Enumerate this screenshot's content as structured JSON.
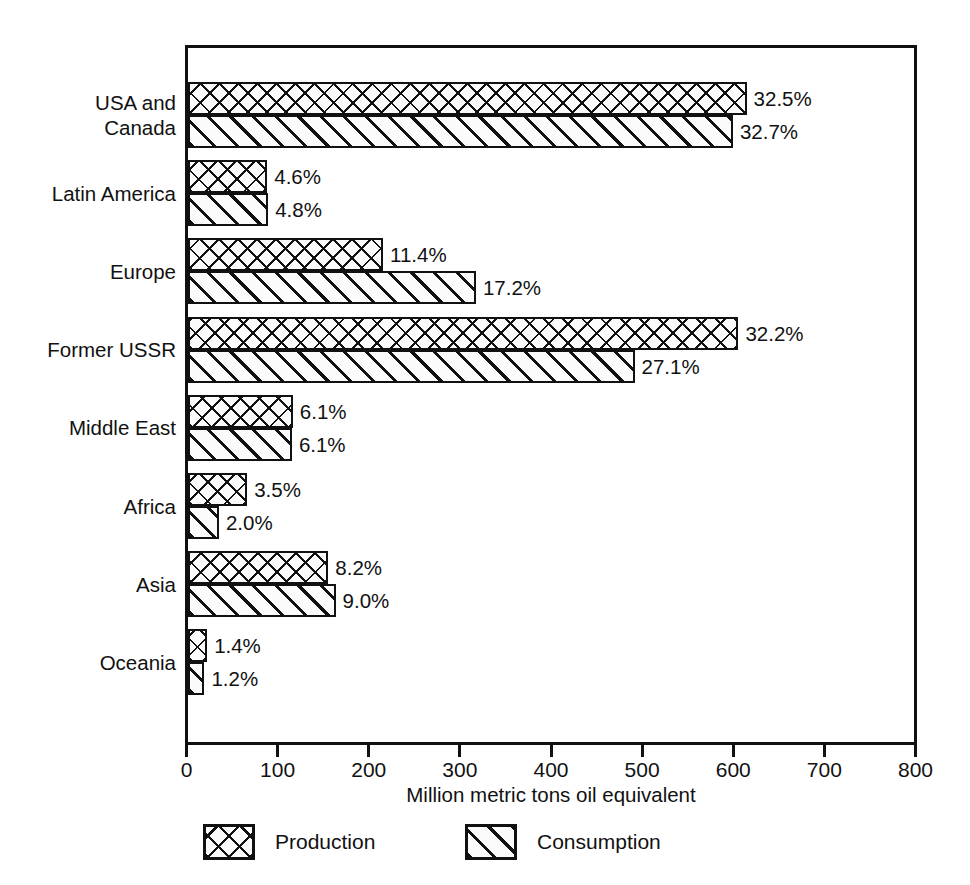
{
  "chart_data": {
    "type": "bar",
    "orientation": "horizontal",
    "title": "",
    "xlabel": "Million metric tons oil equivalent",
    "ylabel": "",
    "xlim": [
      0,
      800
    ],
    "xticks": [
      0,
      100,
      200,
      300,
      400,
      500,
      600,
      700,
      800
    ],
    "xtick_labels": [
      "0",
      "100",
      "200",
      "300",
      "400",
      "500",
      "600",
      "700",
      "800"
    ],
    "grid": false,
    "legend_position": "bottom",
    "categories": [
      "USA and\nCanada",
      "Latin America",
      "Europe",
      "Former USSR",
      "Middle East",
      "Africa",
      "Asia",
      "Oceania"
    ],
    "series": [
      {
        "name": "Production",
        "pattern": "cross-hatch",
        "values": [
          613,
          87,
          214,
          604,
          115,
          65,
          154,
          21
        ],
        "labels": [
          "32.5%",
          "4.6%",
          "11.4%",
          "32.2%",
          "6.1%",
          "3.5%",
          "8.2%",
          "1.4%"
        ]
      },
      {
        "name": "Consumption",
        "pattern": "diagonal-hatch",
        "values": [
          598,
          88,
          316,
          490,
          114,
          34,
          162,
          18
        ],
        "labels": [
          "32.7%",
          "4.8%",
          "17.2%",
          "27.1%",
          "6.1%",
          "2.0%",
          "9.0%",
          "1.2%"
        ]
      }
    ]
  },
  "legend": {
    "items": [
      {
        "label": "Production"
      },
      {
        "label": "Consumption"
      }
    ]
  },
  "colors": {
    "ink": "#111111",
    "background": "#ffffff",
    "bar_fill": "#fbfbfb"
  }
}
